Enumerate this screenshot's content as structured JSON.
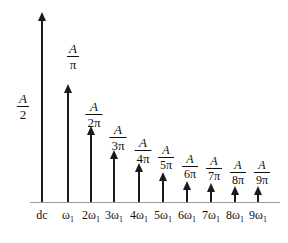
{
  "figure": {
    "title": "",
    "background": "#ffffff",
    "line_color": "#1a1a1a",
    "axis_color": "#9a9a9a"
  },
  "dc_amplitude_label": {
    "numerator": "A",
    "denominator": "2"
  },
  "chart_data": {
    "type": "bar",
    "title": "",
    "xlabel": "",
    "ylabel": "",
    "grid": false,
    "legend": null,
    "categories": [
      "dc",
      "ω₁",
      "2ω₁",
      "3ω₁",
      "4ω₁",
      "5ω₁",
      "6ω₁",
      "7ω₁",
      "8ω₁",
      "9ω₁"
    ],
    "value_labels": [
      "A/2",
      "A/π",
      "A/2π",
      "A/3π",
      "A/4π",
      "A/5π",
      "A/6π",
      "A/7π",
      "A/8π",
      "A/9π"
    ],
    "values": [
      0.5,
      0.3183,
      0.1592,
      0.1061,
      0.0796,
      0.0637,
      0.0531,
      0.0455,
      0.0398,
      0.0354
    ],
    "ylim": [
      0,
      0.55
    ],
    "points": [
      {
        "x_label": "dc",
        "x_sub": "",
        "amp_num": "A",
        "amp_den": "2",
        "value": 0.5,
        "px": 42,
        "tip_y": 12,
        "label_x": 28,
        "label_y": 92,
        "label_side": "left"
      },
      {
        "x_label": "ω",
        "x_sub": "1",
        "amp_num": "A",
        "amp_den": "π",
        "value": 0.3183,
        "px": 68,
        "tip_y": 84,
        "label_x": 73,
        "label_y": 42,
        "label_side": "top"
      },
      {
        "x_label": "2ω",
        "x_sub": "1",
        "amp_num": "A",
        "amp_den": "2π",
        "value": 0.1592,
        "px": 91,
        "tip_y": 126,
        "label_x": 94,
        "label_y": 100,
        "label_side": "top"
      },
      {
        "x_label": "3ω",
        "x_sub": "1",
        "amp_num": "A",
        "amp_den": "3π",
        "value": 0.1061,
        "px": 114,
        "tip_y": 150,
        "label_x": 118,
        "label_y": 123,
        "label_side": "top"
      },
      {
        "x_label": "4ω",
        "x_sub": "1",
        "amp_num": "A",
        "amp_den": "4π",
        "value": 0.0796,
        "px": 139,
        "tip_y": 163,
        "label_x": 143,
        "label_y": 136,
        "label_side": "top"
      },
      {
        "x_label": "5ω",
        "x_sub": "1",
        "amp_num": "A",
        "amp_den": "5π",
        "value": 0.0637,
        "px": 163,
        "tip_y": 172,
        "label_x": 166,
        "label_y": 144,
        "label_side": "top"
      },
      {
        "x_label": "6ω",
        "x_sub": "1",
        "amp_num": "A",
        "amp_den": "6π",
        "value": 0.0531,
        "px": 187,
        "tip_y": 181,
        "label_x": 190,
        "label_y": 153,
        "label_side": "top"
      },
      {
        "x_label": "7ω",
        "x_sub": "1",
        "amp_num": "A",
        "amp_den": "7π",
        "value": 0.0455,
        "px": 211,
        "tip_y": 183,
        "label_x": 214,
        "label_y": 155,
        "label_side": "top"
      },
      {
        "x_label": "8ω",
        "x_sub": "1",
        "amp_num": "A",
        "amp_den": "8π",
        "value": 0.0398,
        "px": 235,
        "tip_y": 186,
        "label_x": 238,
        "label_y": 159,
        "label_side": "top"
      },
      {
        "x_label": "9ω",
        "x_sub": "1",
        "amp_num": "A",
        "amp_den": "9π",
        "value": 0.0354,
        "px": 258,
        "tip_y": 186,
        "label_x": 262,
        "label_y": 159,
        "label_side": "top"
      }
    ]
  }
}
